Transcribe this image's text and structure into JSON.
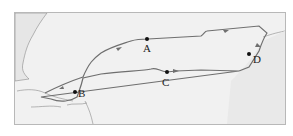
{
  "map": {
    "type": "route-map",
    "description": "Circular voyage route across an ocean between two coastlines",
    "points": [
      {
        "id": "A",
        "label": "A"
      },
      {
        "id": "B",
        "label": "B"
      },
      {
        "id": "C",
        "label": "C"
      },
      {
        "id": "D",
        "label": "D"
      }
    ],
    "colors": {
      "route": "#6f6f6f",
      "land": "#e6e6e6",
      "sea": "#f1f1f1",
      "coast": "#8a8a8a",
      "point": "#111111",
      "border": "#b8b8b8"
    }
  }
}
